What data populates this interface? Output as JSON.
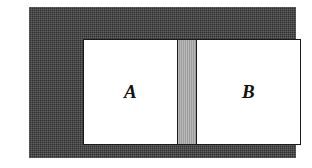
{
  "figure": {
    "kind": "partitioned-container-diagram",
    "frame": {
      "name": "container-wall",
      "fill_color": "#3b3b3b",
      "texture": "dithered-halftone"
    },
    "interior": {
      "name": "container-interior",
      "fill_color": "#ffffff",
      "outline_color": "#1a1a1a"
    },
    "partition": {
      "name": "partition",
      "fill_color": "#a6a6a6",
      "border_color": "#1a1a1a",
      "orientation": "vertical"
    },
    "chambers": [
      {
        "id": "a",
        "label": "A",
        "fill_color": "#ffffff"
      },
      {
        "id": "b",
        "label": "B",
        "fill_color": "#ffffff"
      }
    ]
  }
}
